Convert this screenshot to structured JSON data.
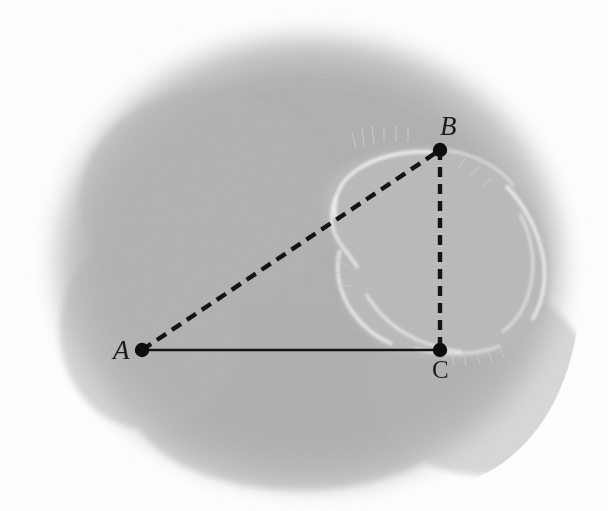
{
  "figure": {
    "kind": "grayscale-scan-with-overlay-triangle",
    "background_color": "#ffffff",
    "body_fill": "#b0b0b0",
    "inner_organ_fill": "#b9b9b9",
    "rim_highlight_color": "#f2f2f2",
    "overlay_stroke_color": "#141414"
  },
  "labels": {
    "A": "A",
    "B": "B",
    "C": "C"
  },
  "points": {
    "A": {
      "label": "A",
      "x": 142,
      "y": 350
    },
    "B": {
      "label": "B",
      "x": 440,
      "y": 150
    },
    "C": {
      "label": "C",
      "x": 440,
      "y": 350
    }
  },
  "segments": [
    {
      "name": "AC",
      "from": "A",
      "to": "C",
      "style": "solid"
    },
    {
      "name": "AB",
      "from": "A",
      "to": "B",
      "style": "dashed"
    },
    {
      "name": "BC",
      "from": "B",
      "to": "C",
      "style": "dashed"
    }
  ],
  "chart_data": {
    "type": "scatter",
    "title": "",
    "xlabel": "",
    "ylabel": "",
    "x": [
      142,
      440,
      440
    ],
    "y": [
      350,
      150,
      350
    ],
    "point_labels": [
      "A",
      "B",
      "C"
    ],
    "grid": false,
    "legend": "none",
    "annotations": [
      "Solid segment from A to C (horizontal base)",
      "Dashed segment from A to B (hypotenuse)",
      "Dashed segment from B to C (vertical leg)",
      "Right angle at C"
    ]
  }
}
